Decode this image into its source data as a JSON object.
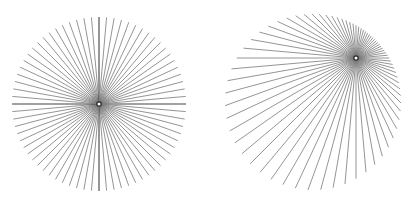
{
  "figure": {
    "width": 414,
    "height": 208,
    "background": "#ffffff",
    "line_color": "#7a7a7a",
    "axis_line_color": "#444444",
    "line_width": 0.8,
    "panels": [
      {
        "name": "centered-radial-lines",
        "circle_center": [
          99,
          104
        ],
        "radius": 87,
        "focus_point": [
          99,
          104
        ],
        "num_lines": 72,
        "emphasize_axes": true,
        "marker_color": "#ffffff",
        "marker_stroke": "#222222"
      },
      {
        "name": "offset-radial-lines",
        "circle_center": [
          313,
          102
        ],
        "radius": 88,
        "focus_point": [
          356,
          58
        ],
        "num_lines": 72,
        "emphasize_axes": false,
        "marker_color": "#ffffff",
        "marker_stroke": "#222222"
      }
    ]
  }
}
